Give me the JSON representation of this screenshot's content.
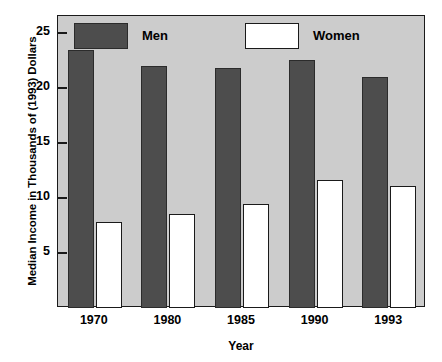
{
  "chart_data": {
    "type": "bar",
    "title": "",
    "xlabel": "Year",
    "ylabel": "Median Income in Thousands of (1993) Dollars",
    "categories": [
      "1970",
      "1980",
      "1985",
      "1990",
      "1993"
    ],
    "series": [
      {
        "name": "Men",
        "values": [
          23.4,
          22.0,
          21.8,
          22.5,
          21.0
        ],
        "color": "#4d4d4d"
      },
      {
        "name": "Women",
        "values": [
          7.8,
          8.5,
          9.4,
          11.6,
          11.1
        ],
        "color": "#ffffff"
      }
    ],
    "ylim": [
      0,
      26.5
    ],
    "yticks": [
      5,
      10,
      15,
      20,
      25
    ],
    "ytick_labels": [
      "5",
      "10",
      "15",
      "20",
      "25"
    ],
    "grid": false,
    "legend_position": "top-inside",
    "plot_background": "#cccccc",
    "axis_color": "#1a1a1a"
  },
  "legend": {
    "men_label": "Men",
    "women_label": "Women"
  }
}
